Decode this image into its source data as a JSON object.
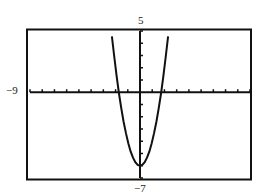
{
  "chart_data": {
    "type": "line",
    "title": "",
    "xlabel": "",
    "ylabel": "",
    "window": {
      "xmin": -9,
      "xmax": 9,
      "ymin": -7,
      "ymax": 5,
      "xscl": 1,
      "yscl": 1
    },
    "xlim": [
      -9,
      9
    ],
    "ylim": [
      -7,
      5
    ],
    "grid": false,
    "legend": null,
    "tick_labels": {
      "left": "-9",
      "top": "5",
      "bottom": "-7"
    },
    "series": [
      {
        "name": "y = 2x^2 - 6",
        "x": [
          -2.45,
          -2.25,
          -2.0,
          -1.75,
          -1.5,
          -1.25,
          -1.0,
          -0.75,
          -0.5,
          -0.25,
          0,
          0.25,
          0.5,
          0.75,
          1.0,
          1.25,
          1.5,
          1.75,
          2.0,
          2.25,
          2.45
        ],
        "values": [
          6.0,
          4.13,
          2.0,
          0.13,
          -1.5,
          -2.88,
          -4.0,
          -4.88,
          -5.5,
          -5.88,
          -6.0,
          -5.88,
          -5.5,
          -4.88,
          -4.0,
          -2.88,
          -1.5,
          0.13,
          2.0,
          4.13,
          6.0
        ]
      }
    ],
    "annotations": []
  },
  "labels": {
    "xmin": "−9",
    "ymax": "5",
    "ymin": "−7"
  }
}
